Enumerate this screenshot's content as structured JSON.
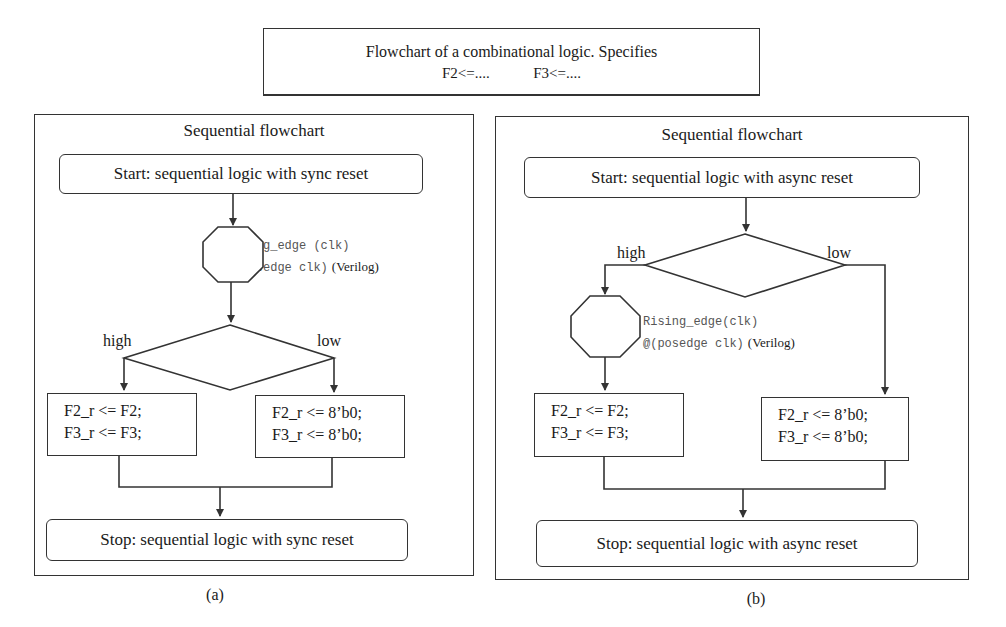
{
  "header": {
    "line1": "Flowchart of a combinational logic. Specifies",
    "line2a": "F2<=....",
    "line2b": "F3<=...."
  },
  "panel_a": {
    "title": "Sequential flowchart",
    "start": "Start: sequential logic with sync reset",
    "clock_line1": "Rising_edge (clk)",
    "clock_line2": "@(posedge clk)",
    "clock_lang": "(Verilog)",
    "decision": "rst_b",
    "high_label": "high",
    "low_label": "low",
    "high_box_line1": "F2_r <= F2;",
    "high_box_line2": "F3_r <= F3;",
    "low_box_line1": "F2_r <= 8’b0;",
    "low_box_line2": "F3_r <= 8’b0;",
    "stop": "Stop: sequential logic with sync reset",
    "caption": "(a)"
  },
  "panel_b": {
    "title": "Sequential flowchart",
    "start": "Start: sequential logic with async reset",
    "decision": "rst_b",
    "high_label": "high",
    "low_label": "low",
    "clock_line1": "Rising_edge(clk)",
    "clock_line2": "@(posedge clk)",
    "clock_lang": "(Verilog)",
    "high_box_line1": "F2_r <= F2;",
    "high_box_line2": "F3_r <= F3;",
    "low_box_line1": "F2_r <= 8’b0;",
    "low_box_line2": "F3_r <= 8’b0;",
    "stop": "Stop: sequential logic with async reset",
    "caption": "(b)"
  },
  "colors": {
    "stroke": "#333333",
    "text": "#1a1a1a",
    "mono_text": "#555555"
  }
}
